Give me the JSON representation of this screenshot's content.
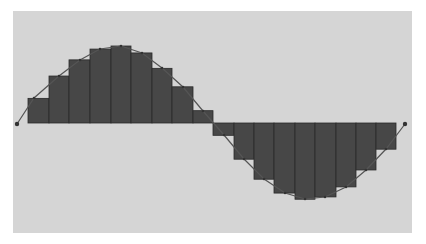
{
  "chart_data": {
    "type": "bar",
    "title": "",
    "xlabel": "",
    "ylabel": "",
    "grid": false,
    "legend": null,
    "baseline_y_px": 123,
    "amplitude_px": 77,
    "bars": {
      "x_edges_px": [
        28,
        49,
        69,
        90,
        111,
        131,
        152,
        172,
        193,
        213,
        234,
        254,
        274,
        295,
        315,
        336,
        356,
        376,
        396
      ],
      "values": [
        0.32,
        0.61,
        0.82,
        0.96,
        1.0,
        0.91,
        0.71,
        0.47,
        0.16,
        -0.16,
        -0.47,
        -0.73,
        -0.91,
        -0.99,
        -0.96,
        -0.83,
        -0.61,
        -0.34
      ],
      "color": "#474747"
    },
    "curve": {
      "points_px": [
        [
          17,
          124
        ],
        [
          34,
          98
        ],
        [
          59,
          76
        ],
        [
          80,
          60
        ],
        [
          100,
          49
        ],
        [
          121,
          46
        ],
        [
          142,
          53
        ],
        [
          162,
          68
        ],
        [
          183,
          87
        ],
        [
          203,
          111
        ],
        [
          224,
          135
        ],
        [
          244,
          159
        ],
        [
          264,
          179
        ],
        [
          285,
          193
        ],
        [
          305,
          199
        ],
        [
          325,
          197
        ],
        [
          346,
          187
        ],
        [
          366,
          170
        ],
        [
          386,
          149
        ],
        [
          405,
          124
        ]
      ],
      "color": "#555555"
    },
    "background_color": "#d5d5d5"
  }
}
